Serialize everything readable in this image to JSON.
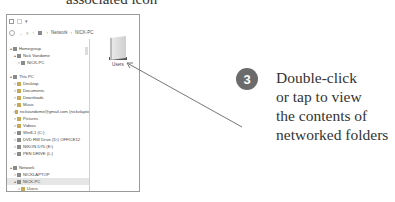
{
  "caption_top": "associated icon",
  "window": {
    "address": {
      "crumbs": [
        "Network",
        "NICK-PC"
      ]
    },
    "tree": [
      {
        "label": "Homegroup",
        "level": 0,
        "expander": "▴",
        "icon": "homegroup-icon"
      },
      {
        "label": "Nick Vandome",
        "level": 1,
        "expander": "▴",
        "icon": "user-icon"
      },
      {
        "label": "NICK-PC",
        "level": 2,
        "expander": ">",
        "icon": "computer-icon"
      },
      {
        "label": "",
        "gap": true
      },
      {
        "label": "This PC",
        "level": 0,
        "expander": "▴",
        "icon": "pc-icon"
      },
      {
        "label": "Desktop",
        "level": 1,
        "expander": ">",
        "icon": "desktop-icon"
      },
      {
        "label": "Documents",
        "level": 1,
        "expander": ">",
        "icon": "documents-icon"
      },
      {
        "label": "Downloads",
        "level": 1,
        "expander": ">",
        "icon": "downloads-icon"
      },
      {
        "label": "Music",
        "level": 1,
        "expander": ">",
        "icon": "music-icon"
      },
      {
        "label": "nickvandome@gmail.com (nickvlapto",
        "level": 1,
        "expander": ">",
        "icon": "user-folder-icon"
      },
      {
        "label": "Pictures",
        "level": 1,
        "expander": ">",
        "icon": "pictures-icon"
      },
      {
        "label": "Videos",
        "level": 1,
        "expander": ">",
        "icon": "videos-icon"
      },
      {
        "label": "Win8-1 (C:)",
        "level": 1,
        "expander": ">",
        "icon": "drive-icon"
      },
      {
        "label": "DVD RW Drive (D:) OFFICE12",
        "level": 1,
        "expander": ">",
        "icon": "dvd-icon"
      },
      {
        "label": "NIKON D70 (E:)",
        "level": 1,
        "expander": ">",
        "icon": "camera-drive-icon"
      },
      {
        "label": "PEN DRIVE (L:)",
        "level": 1,
        "expander": ">",
        "icon": "usb-drive-icon"
      },
      {
        "label": "",
        "gap": true
      },
      {
        "label": "Network",
        "level": 0,
        "expander": "▴",
        "icon": "network-icon"
      },
      {
        "label": "NICKLAPTOP",
        "level": 1,
        "expander": ">",
        "icon": "computer-icon"
      },
      {
        "label": "NICK-PC",
        "level": 1,
        "expander": "▴",
        "icon": "computer-icon",
        "selected": true
      },
      {
        "label": "Users",
        "level": 2,
        "expander": ">",
        "icon": "shared-folder-icon"
      }
    ],
    "content": {
      "items": [
        {
          "label": "Users"
        }
      ]
    }
  },
  "badge": {
    "number": "3",
    "color": "#6b6b6b"
  },
  "callout": {
    "lines": [
      "Double-click",
      "or tap to view",
      "the contents of",
      "networked folders"
    ]
  }
}
